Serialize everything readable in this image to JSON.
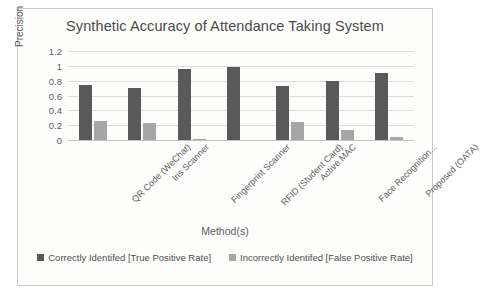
{
  "chart_data": {
    "type": "bar",
    "title": "Synthetic Accuracy of Attendance Taking System",
    "xlabel": "Method(s)",
    "ylabel": "Precision",
    "ylim": [
      0,
      1.2
    ],
    "yticks": [
      "0",
      "0.2",
      "0.4",
      "0.6",
      "0.8",
      "1",
      "1.2"
    ],
    "grid": true,
    "legend_position": "bottom",
    "categories": [
      "QR Code (WeChat)",
      "Iris Scanner",
      "Fingerprint Scanner",
      "RFID (Student Card)",
      "Active MAC",
      "Face Recognition...",
      "Proposed (OATA)"
    ],
    "series": [
      {
        "name": "Correctly Identifed [True Positive Rate]",
        "color": "#595959",
        "values": [
          0.74,
          0.7,
          0.96,
          0.98,
          0.73,
          0.8,
          0.91
        ]
      },
      {
        "name": "Incorrectly Identifed [False Positive Rate]",
        "color": "#a6a6a6",
        "values": [
          0.25,
          0.23,
          0.01,
          0.0,
          0.24,
          0.14,
          0.04
        ]
      }
    ]
  }
}
